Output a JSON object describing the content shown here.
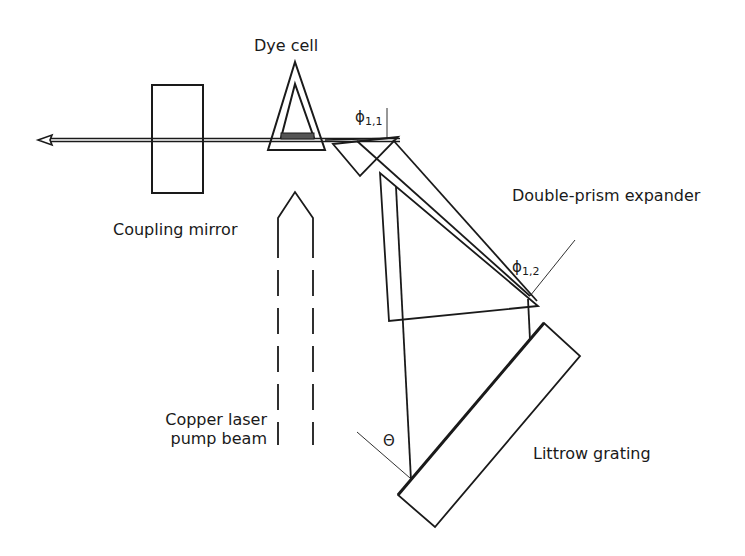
{
  "diagram": {
    "labels": {
      "dye_cell": "Dye cell",
      "coupling_mirror": "Coupling mirror",
      "double_prism_expander": "Double-prism expander",
      "pump_beam_line1": "Copper laser",
      "pump_beam_line2": "pump beam",
      "littrow_grating": "Littrow grating"
    },
    "angles": {
      "phi_1_1": {
        "symbol": "ϕ",
        "sub": "1,1"
      },
      "phi_1_2": {
        "symbol": "ϕ",
        "sub": "1,2"
      },
      "theta": {
        "symbol": "Θ"
      }
    },
    "components": [
      "output-beam-arrow",
      "coupling-mirror",
      "dye-cell",
      "pump-beam",
      "prism-1",
      "prism-2",
      "littrow-grating"
    ],
    "colors": {
      "line": "#1a1a1a",
      "background": "#ffffff"
    }
  }
}
